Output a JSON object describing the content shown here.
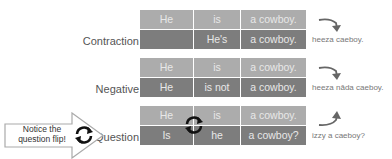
{
  "rows": [
    {
      "label": "Contraction",
      "top": [
        "He",
        "is",
        "a cowboy."
      ],
      "bottom": [
        "",
        "He's",
        "a cowboy."
      ],
      "pronunciation": "heeza caeboy.",
      "arrow": "curve-down-arrow"
    },
    {
      "label": "Negative",
      "top": [
        "He",
        "is",
        "a cowboy."
      ],
      "bottom": [
        "He",
        "is not",
        "a cowboy."
      ],
      "pronunciation": "heeza nāda caeboy.",
      "arrow": "curve-down-arrow"
    },
    {
      "label": "Question",
      "top": [
        "He",
        "is",
        "a cowboy."
      ],
      "bottom": [
        "Is",
        "he",
        "a cowboy?"
      ],
      "pronunciation": "izzy a caeboy?",
      "arrow": "curve-up-arrow"
    }
  ],
  "callout": {
    "text_line1": "Notice the",
    "text_line2": "question flip!",
    "icon": "cycle-arrows-icon"
  },
  "colors": {
    "top_cell": "#acacac",
    "bottom_cell": "#7d7d7d",
    "cell_text": "#e8e8e8"
  }
}
